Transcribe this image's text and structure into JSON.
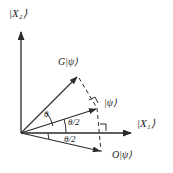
{
  "figure": {
    "type": "vector-diagram",
    "background": "#ffffff",
    "stroke_color": "#2b2b2b",
    "axes": {
      "y_label": "|X₂⟩",
      "x_label": "|X₁⟩",
      "origin": [
        21,
        133
      ]
    },
    "vectors": [
      {
        "name": "G-psi",
        "label": "G|ψ⟩",
        "from": [
          21,
          133
        ],
        "to": [
          78,
          76
        ],
        "style": "solid"
      },
      {
        "name": "psi",
        "label": "|ψ⟩",
        "from": [
          21,
          133
        ],
        "to": [
          97,
          108
        ],
        "style": "solid"
      },
      {
        "name": "O-psi",
        "label": "O|ψ⟩",
        "from": [
          21,
          133
        ],
        "to": [
          101,
          152
        ],
        "style": "solid"
      }
    ],
    "angles": [
      {
        "name": "theta",
        "label": "θ",
        "between": [
          "G-psi",
          "psi"
        ]
      },
      {
        "name": "theta-half-upper",
        "label": "θ/2",
        "between": [
          "psi",
          "x-axis"
        ]
      },
      {
        "name": "theta-half-lower",
        "label": "θ/2",
        "between": [
          "x-axis",
          "O-psi"
        ]
      }
    ],
    "dashed_lines": [
      {
        "name": "g-to-psi-projection",
        "from": [
          78,
          76
        ],
        "to": [
          97,
          108
        ]
      },
      {
        "name": "psi-to-o-projection",
        "from": [
          97,
          108
        ],
        "to": [
          101,
          152
        ]
      }
    ],
    "right_angle_marks": [
      {
        "name": "right-angle-at-psi",
        "at": [
          94,
          103
        ]
      },
      {
        "name": "right-angle-at-xaxis",
        "at": [
          104,
          122
        ]
      }
    ]
  },
  "labels": {
    "y_axis": "|X₂⟩",
    "x_axis": "|X₁⟩",
    "g_psi": "G|ψ⟩",
    "psi": "|ψ⟩",
    "o_psi": "O|ψ⟩",
    "theta": "θ",
    "theta_half_upper": "θ/2",
    "theta_half_lower": "θ/2"
  }
}
